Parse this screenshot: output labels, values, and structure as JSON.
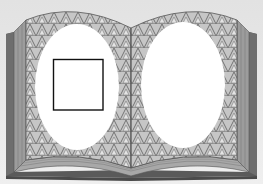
{
  "illustration": {
    "subject": "open book with patterned pages",
    "colors": {
      "background": "#e9e9e9",
      "cover": "#6f6f6f",
      "cover_dark": "#4f4f4f",
      "page_edges": "#9a9a9a",
      "page_edges_light": "#b8b8b8",
      "pattern_base": "#c4c4c4",
      "pattern_line": "#6a6a6a",
      "frame_fill": "#ffffff",
      "square_stroke": "#111111"
    },
    "left_page": {
      "frame": {
        "shape": "oval",
        "cx": 77,
        "cy": 87,
        "rx": 42,
        "ry": 63
      },
      "inner_square": {
        "x": 53,
        "y": 59,
        "width": 50,
        "height": 51
      }
    },
    "right_page": {
      "frame": {
        "shape": "oval",
        "cx": 183,
        "cy": 85,
        "rx": 42,
        "ry": 63
      }
    }
  }
}
